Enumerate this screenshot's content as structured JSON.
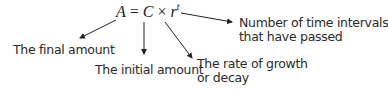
{
  "formula": {
    "lhs": "A",
    "equals": "=",
    "c": "C",
    "times": "×",
    "r": "r",
    "exponent": "t"
  },
  "labels": {
    "final_amount": "The final amount",
    "initial_amount": "The initial amount",
    "rate_line1": "The rate of growth",
    "rate_line2": "or decay",
    "intervals_line1": "Number of time intervals",
    "intervals_line2": "that have passed"
  },
  "colors": {
    "text": "#2a2a2a",
    "arrow": "#222222",
    "background": "#ffffff"
  }
}
